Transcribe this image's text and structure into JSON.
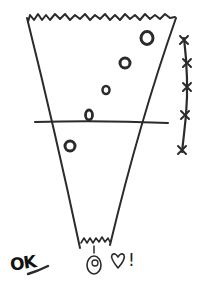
{
  "sketch": {
    "colors": {
      "ink": "#2b2b2b",
      "background": "#ffffff"
    },
    "funnel": {
      "top_edge": "jagged",
      "bottom_edge": "jagged",
      "threshold_line": true
    },
    "circles": [
      {
        "x": 147,
        "y": 38,
        "r": 6
      },
      {
        "x": 125,
        "y": 63,
        "r": 5
      },
      {
        "x": 106,
        "y": 90,
        "r": 3.5
      },
      {
        "x": 89,
        "y": 115,
        "r": 4
      },
      {
        "x": 70,
        "y": 146,
        "r": 5
      }
    ],
    "x_marks": [
      {
        "x": 184,
        "y": 40
      },
      {
        "x": 187,
        "y": 63
      },
      {
        "x": 187,
        "y": 87
      },
      {
        "x": 185,
        "y": 115
      },
      {
        "x": 182,
        "y": 150
      }
    ],
    "labels": {
      "ok": "OK",
      "exclaim": "!"
    },
    "icons": [
      "face-icon",
      "heart-icon"
    ]
  }
}
